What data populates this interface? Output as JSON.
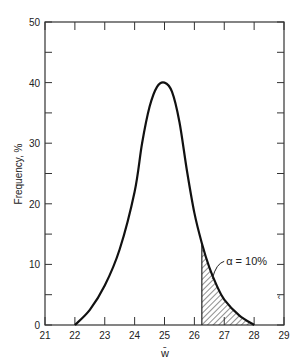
{
  "chart_data": {
    "type": "area",
    "title": "",
    "xlabel": "w̄",
    "ylabel": "Frequency, %",
    "xlim": [
      21,
      29
    ],
    "ylim": [
      0,
      50
    ],
    "x_ticks": [
      21,
      22,
      23,
      24,
      25,
      26,
      27,
      28,
      29
    ],
    "y_ticks": [
      0,
      10,
      20,
      30,
      40,
      50
    ],
    "grid": false,
    "series": [
      {
        "name": "distribution",
        "x": [
          22.0,
          22.5,
          23.0,
          23.5,
          24.0,
          24.25,
          24.5,
          24.75,
          25.0,
          25.25,
          25.5,
          25.75,
          26.0,
          26.25,
          26.5,
          26.75,
          27.0,
          27.5,
          28.0
        ],
        "y": [
          0.0,
          2.5,
          6.5,
          12.5,
          22.0,
          30.0,
          36.0,
          39.3,
          40.0,
          38.5,
          33.5,
          25.5,
          18.5,
          13.5,
          9.5,
          6.5,
          4.2,
          1.6,
          0.0
        ]
      }
    ],
    "shaded_region": {
      "x_start": 26.25,
      "x_end": 28.0,
      "pattern": "hatched"
    },
    "annotations": [
      {
        "text": "α = 10%",
        "x": 27.4,
        "y": 10.5
      }
    ]
  }
}
